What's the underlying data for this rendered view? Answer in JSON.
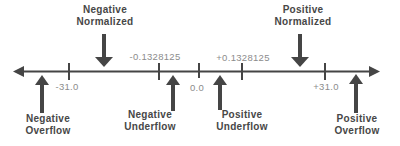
{
  "regions": {
    "negative_normalized": "Negative\nNormalized",
    "positive_normalized": "Positive\nNormalized",
    "negative_overflow": "Negative\nOverflow",
    "negative_underflow": "Negative\nUnderflow",
    "positive_underflow": "Positive\nUnderflow",
    "positive_overflow": "Positive\nOverflow"
  },
  "axis_values": {
    "neg_max": "-31.0",
    "neg_min": "-0.1328125",
    "zero": "0.0",
    "pos_min": "+0.1328125",
    "pos_max": "+31.0"
  },
  "colors": {
    "background": "#ffffff",
    "label_text": "#474747",
    "value_text": "#8c8c8c",
    "axis": "#454545"
  }
}
